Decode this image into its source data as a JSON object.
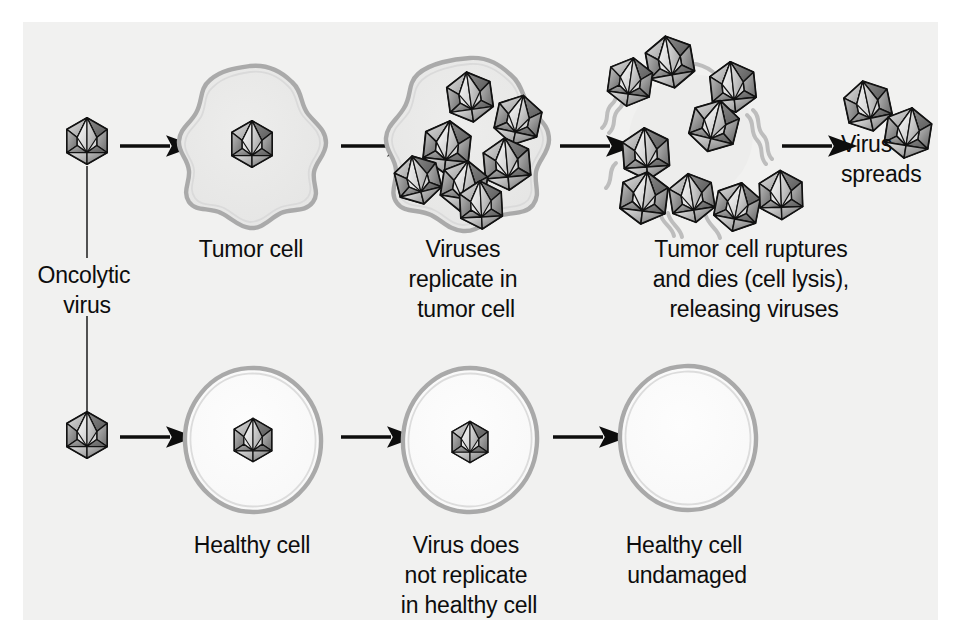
{
  "figure": {
    "background_color": "#ffffff",
    "panel_color": "#f1f1f0",
    "ink_color": "#0d0d0d",
    "membrane_color": "#a8a8a8",
    "tumor_fill": "#e9e9e8",
    "healthy_fill": "#fbfbfb"
  },
  "labels": {
    "oncolytic_virus": [
      "Oncolytic",
      "virus"
    ],
    "tumor_cell": [
      "Tumor cell"
    ],
    "viruses_replicate": [
      "Viruses",
      "replicate in",
      "tumor cell"
    ],
    "tumor_ruptures": [
      "Tumor cell ruptures",
      "and dies (cell lysis),",
      "releasing viruses"
    ],
    "virus_spreads": [
      "Virus",
      "spreads"
    ],
    "healthy_cell": [
      "Healthy cell"
    ],
    "virus_not_replicate": [
      "Virus does",
      "not replicate",
      "in healthy cell"
    ],
    "healthy_undamaged": [
      "Healthy cell",
      "undamaged"
    ]
  },
  "pathways": [
    {
      "name": "tumor-pathway",
      "row": "top",
      "steps": [
        {
          "id": "virus-particle",
          "label_key": "oncolytic_virus",
          "virus_count": 1
        },
        {
          "id": "tumor-cell-infected",
          "label_key": "tumor_cell",
          "virus_count": 1
        },
        {
          "id": "tumor-cell-replicating",
          "label_key": "viruses_replicate",
          "virus_count": 7
        },
        {
          "id": "tumor-cell-lysed",
          "label_key": "tumor_ruptures",
          "virus_count": 9
        },
        {
          "id": "virus-spreads",
          "label_key": "virus_spreads",
          "virus_count": 2
        }
      ]
    },
    {
      "name": "healthy-pathway",
      "row": "bottom",
      "steps": [
        {
          "id": "virus-particle",
          "label_key": "oncolytic_virus",
          "virus_count": 1
        },
        {
          "id": "healthy-cell-entered",
          "label_key": "healthy_cell",
          "virus_count": 1
        },
        {
          "id": "healthy-cell-no-replication",
          "label_key": "virus_not_replicate",
          "virus_count": 1
        },
        {
          "id": "healthy-cell-undamaged",
          "label_key": "healthy_undamaged",
          "virus_count": 0
        }
      ]
    }
  ],
  "arrows": {
    "count": 7,
    "top_row": 4,
    "bottom_row": 3
  },
  "virus_positions": {
    "top_start": [
      {
        "x": 87,
        "y": 141,
        "r": 23
      }
    ],
    "tumor_infected": [
      {
        "x": 252,
        "y": 144,
        "r": 23
      }
    ],
    "tumor_replicating": [
      {
        "x": 470,
        "y": 97,
        "r": 25
      },
      {
        "x": 517,
        "y": 118,
        "r": 25
      },
      {
        "x": 448,
        "y": 146,
        "r": 26
      },
      {
        "x": 505,
        "y": 162,
        "r": 26
      },
      {
        "x": 419,
        "y": 178,
        "r": 24
      },
      {
        "x": 463,
        "y": 184,
        "r": 25
      },
      {
        "x": 480,
        "y": 203,
        "r": 24
      }
    ],
    "tumor_lysed": [
      {
        "x": 669,
        "y": 60,
        "r": 26
      },
      {
        "x": 632,
        "y": 80,
        "r": 24
      },
      {
        "x": 731,
        "y": 85,
        "r": 25
      },
      {
        "x": 713,
        "y": 124,
        "r": 26
      },
      {
        "x": 646,
        "y": 152,
        "r": 26
      },
      {
        "x": 643,
        "y": 196,
        "r": 26
      },
      {
        "x": 692,
        "y": 196,
        "r": 24
      },
      {
        "x": 736,
        "y": 205,
        "r": 24
      },
      {
        "x": 779,
        "y": 193,
        "r": 24
      }
    ],
    "spread": [
      {
        "x": 866,
        "y": 104,
        "r": 25
      },
      {
        "x": 906,
        "y": 131,
        "r": 25
      }
    ],
    "bottom_start": [
      {
        "x": 87,
        "y": 435,
        "r": 23
      }
    ],
    "healthy_entered": [
      {
        "x": 253,
        "y": 440,
        "r": 22
      }
    ],
    "healthy_no_replication": [
      {
        "x": 470,
        "y": 442,
        "r": 21
      }
    ]
  }
}
